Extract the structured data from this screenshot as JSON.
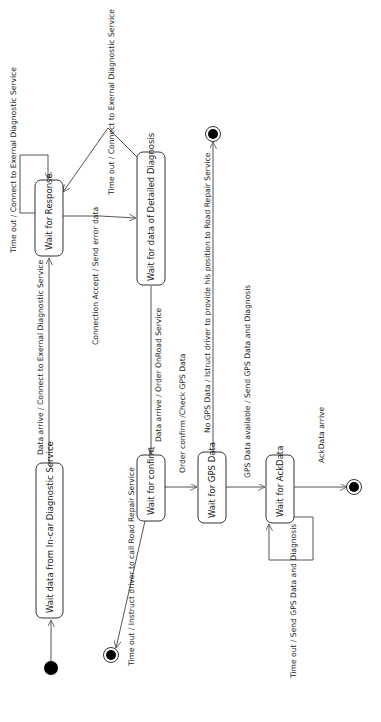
{
  "diagram": {
    "type": "UML state machine",
    "orientation": "rotated 90 degrees counter-clockwise",
    "states": [
      {
        "id": "s_incar",
        "label": "Wait data from In-car Diagnostic Service"
      },
      {
        "id": "s_response",
        "label": "Wait for Response"
      },
      {
        "id": "s_detailed",
        "label": "Wait for data of Detailed Diagnosis"
      },
      {
        "id": "s_confirm",
        "label": "Wait for confirm"
      },
      {
        "id": "s_gps",
        "label": "Wait for GPS Data"
      },
      {
        "id": "s_ack",
        "label": "Wait for AckData"
      }
    ],
    "pseudostates": {
      "initial": "initial",
      "finals": [
        "final_confirm_timeout",
        "final_no_gps",
        "final_ack"
      ]
    },
    "transitions": [
      {
        "from": "initial",
        "to": "s_incar",
        "label": ""
      },
      {
        "from": "s_incar",
        "to": "s_response",
        "label": "Data arrive / Connect to Exernal Diagnostic Service"
      },
      {
        "from": "s_response",
        "to": "s_response",
        "label": "Time out / Connect to Exernal Diagnostic Service"
      },
      {
        "from": "s_response",
        "to": "s_detailed",
        "label": "Connection Accept / Send error data"
      },
      {
        "from": "s_detailed",
        "to": "s_response",
        "label": "Time out / Connect to Exernal Diagnostic Service"
      },
      {
        "from": "s_detailed",
        "to": "s_confirm",
        "label": "Data arrive / Order OnRoad Service"
      },
      {
        "from": "s_confirm",
        "to": "final_confirm_timeout",
        "label": "Time out / Instruct driver to call Road Repair Service"
      },
      {
        "from": "s_confirm",
        "to": "s_gps",
        "label": "Order confirm /Check GPS Data"
      },
      {
        "from": "s_gps",
        "to": "final_no_gps",
        "label": "No GPS Data / Istruct driver to provide his position to Road Repair Service"
      },
      {
        "from": "s_gps",
        "to": "s_ack",
        "label": "GPS Data available / Send GPS Data and Diagnosis"
      },
      {
        "from": "s_ack",
        "to": "s_ack",
        "label": "Time out / Send GPS Data and Diagnosis"
      },
      {
        "from": "s_ack",
        "to": "final_ack",
        "label": "AckData arrive"
      }
    ]
  },
  "labels": {
    "s_incar": "Wait data from In-car Diagnostic Service",
    "s_response": "Wait for Response",
    "s_detailed": "Wait for data of Detailed Diagnosis",
    "s_confirm": "Wait for confirm",
    "s_gps": "Wait for GPS Data",
    "s_ack": "Wait for AckData",
    "t_data_arrive_connect": "Data arrive / Connect to Exernal Diagnostic Service",
    "t_response_timeout": "Time out / Connect to Exernal Diagnostic Service",
    "t_connection_accept": "Connection Accept / Send error data",
    "t_detailed_timeout": "Time out / Connect to Exernal Diagnostic Service",
    "t_data_arrive_order": "Data arrive / Order OnRoad Service",
    "t_confirm_timeout": "Time out / Instruct driver to call Road Repair Service",
    "t_order_confirm": "Order confirm /Check GPS Data",
    "t_no_gps": "No GPS Data / Istruct driver to provide his position to Road Repair Service",
    "t_gps_available": "GPS Data available / Send GPS Data and Diagnosis",
    "t_ack_timeout": "Time out / Send GPS Data and Diagnosis",
    "t_ack_arrive": "AckData arrive"
  },
  "colors": {
    "background": "#ffffff",
    "stroke": "#333333",
    "text": "#222222",
    "node_fill": "#000000"
  }
}
